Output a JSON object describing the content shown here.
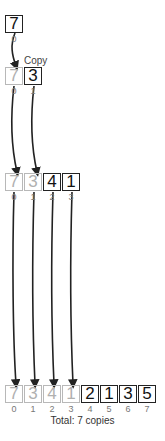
{
  "diagram": {
    "copy_label": "Copy",
    "total_label": "Total: 7 copies",
    "rows": [
      {
        "name": "capacity-1",
        "cells": [
          {
            "value": "7",
            "index": "0",
            "state": "active"
          }
        ]
      },
      {
        "name": "capacity-2",
        "cells": [
          {
            "value": "7",
            "index": "0",
            "state": "faded"
          },
          {
            "value": "3",
            "index": "1",
            "state": "active"
          }
        ]
      },
      {
        "name": "capacity-4",
        "cells": [
          {
            "value": "7",
            "index": "0",
            "state": "faded"
          },
          {
            "value": "3",
            "index": "1",
            "state": "faded"
          },
          {
            "value": "4",
            "index": "2",
            "state": "active"
          },
          {
            "value": "1",
            "index": "3",
            "state": "active"
          }
        ]
      },
      {
        "name": "capacity-8",
        "cells": [
          {
            "value": "7",
            "index": "0",
            "state": "faded"
          },
          {
            "value": "3",
            "index": "1",
            "state": "faded"
          },
          {
            "value": "4",
            "index": "2",
            "state": "faded"
          },
          {
            "value": "1",
            "index": "3",
            "state": "faded"
          },
          {
            "value": "2",
            "index": "4",
            "state": "active"
          },
          {
            "value": "1",
            "index": "5",
            "state": "active"
          },
          {
            "value": "3",
            "index": "6",
            "state": "active"
          },
          {
            "value": "5",
            "index": "7",
            "state": "active"
          }
        ]
      }
    ],
    "colors": {
      "active_border": "#222222",
      "faded_border": "#b8b8b8",
      "faded_text": "#b0b0b0",
      "arrow": "#222222"
    }
  }
}
